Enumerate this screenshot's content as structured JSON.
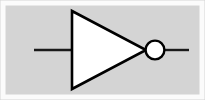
{
  "figure": {
    "name": "NOT gate (inverter) logic symbol",
    "kind": "schematic-symbol",
    "alt_text": "Digital logic NOT gate: a triangle pointing right with a small inversion bubble at its tip, an input wire on the left and an output wire on the right",
    "width": 205,
    "height": 100
  },
  "colors": {
    "background": "#d4d4d4",
    "frame": "#fbfbfb",
    "stroke": "#000000",
    "body_fill": "#ffffff",
    "bubble_fill": "#ffffff",
    "wire": "#1a1a1a"
  },
  "geometry": {
    "frame": {
      "x": 3,
      "y": 3,
      "width": 199,
      "height": 94,
      "stroke_width": 5
    },
    "triangle": {
      "label": "inverter-body",
      "points": "72,11 72,89 146,50",
      "stroke_width": 2.6
    },
    "bubble": {
      "label": "inversion-bubble",
      "cx": 155,
      "cy": 50,
      "r": 9.4,
      "stroke_width": 2.4
    },
    "input_wire": {
      "label": "input-wire",
      "x1": 34,
      "y1": 50,
      "x2": 72,
      "y2": 50,
      "stroke_width": 2.4
    },
    "output_wire": {
      "label": "output-wire",
      "x1": 164,
      "y1": 50,
      "x2": 189,
      "y2": 50,
      "stroke_width": 2.4
    }
  }
}
